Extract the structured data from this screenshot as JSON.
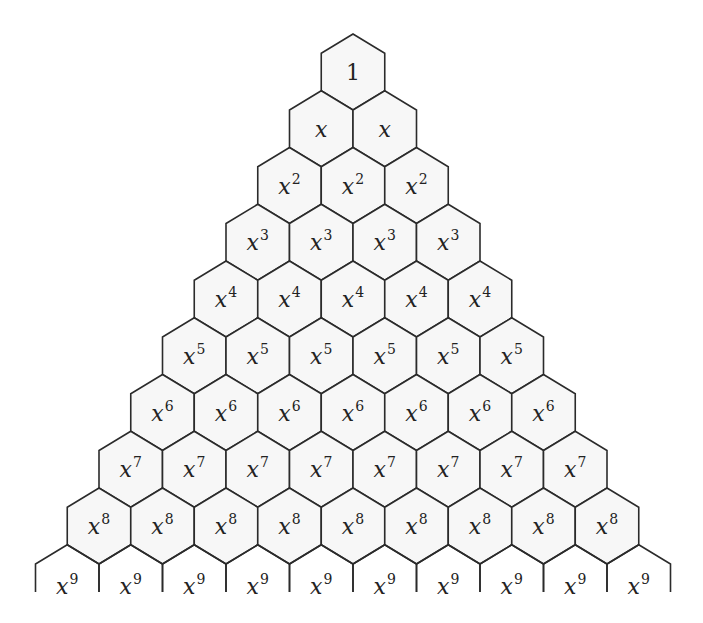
{
  "diagram": {
    "title": "",
    "type": "hexagonal pyramid of powers of x",
    "colors": {
      "background": "#ffffff",
      "hex_fill": "#f7f7f7",
      "stroke": "#2b2b2b",
      "text": "#222222"
    },
    "geometry": {
      "apex_x": 353,
      "apex_y": 34,
      "hex_width": 63.5,
      "row_step": 56.75,
      "side_length": 37.5,
      "diag_height": 19.25,
      "last_row_cut_y": 592
    },
    "rows": [
      {
        "row": 0,
        "count": 1,
        "base": "",
        "exponent": "",
        "label": "1"
      },
      {
        "row": 1,
        "count": 2,
        "base": "x",
        "exponent": "",
        "label": "x"
      },
      {
        "row": 2,
        "count": 3,
        "base": "x",
        "exponent": "2",
        "label": "x^2"
      },
      {
        "row": 3,
        "count": 4,
        "base": "x",
        "exponent": "3",
        "label": "x^3"
      },
      {
        "row": 4,
        "count": 5,
        "base": "x",
        "exponent": "4",
        "label": "x^4"
      },
      {
        "row": 5,
        "count": 6,
        "base": "x",
        "exponent": "5",
        "label": "x^5"
      },
      {
        "row": 6,
        "count": 7,
        "base": "x",
        "exponent": "6",
        "label": "x^6"
      },
      {
        "row": 7,
        "count": 8,
        "base": "x",
        "exponent": "7",
        "label": "x^7"
      },
      {
        "row": 8,
        "count": 9,
        "base": "x",
        "exponent": "8",
        "label": "x^8"
      },
      {
        "row": 9,
        "count": 10,
        "base": "x",
        "exponent": "9",
        "label": "x^9",
        "partial": true
      }
    ]
  }
}
